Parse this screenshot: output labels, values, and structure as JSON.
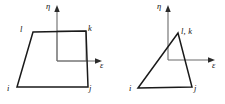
{
  "figure": {
    "colors": {
      "element_outline": "#1a1a1a",
      "axis": "#6b6b6b",
      "reference_square": "#8c8c8c",
      "background": "#ffffff",
      "label_text": "#111111"
    },
    "panels": [
      {
        "id": "left",
        "name": "quadrilateral-element",
        "shape_type": "quadrilateral",
        "axes": {
          "eta_label": "η",
          "epsilon_label": "ε",
          "origin": [
            57,
            61
          ],
          "eta_tip": [
            57,
            7
          ],
          "epsilon_tip": [
            101,
            61
          ]
        },
        "reference_square": {
          "x": 57,
          "y": 31,
          "width": 29,
          "height": 30
        },
        "nodes": [
          {
            "key": "i",
            "label": "i",
            "vertex": [
              17,
              87
            ],
            "label_pos": [
              7,
              84
            ]
          },
          {
            "key": "j",
            "label": "j",
            "vertex": [
              88,
              87
            ],
            "label_pos": [
              89,
              84
            ]
          },
          {
            "key": "k",
            "label": "k",
            "vertex": [
              86,
              31
            ],
            "label_pos": [
              88,
              24
            ]
          },
          {
            "key": "l",
            "label": "l",
            "vertex": [
              33,
              32
            ],
            "label_pos": [
              20,
              25
            ]
          }
        ],
        "outline_path": [
          [
            17,
            87
          ],
          [
            88,
            87
          ],
          [
            86,
            31
          ],
          [
            33,
            32
          ]
        ]
      },
      {
        "id": "right",
        "name": "degenerated-triangle-element",
        "shape_type": "triangle",
        "axes": {
          "eta_label": "η",
          "epsilon_label": "ε",
          "origin": [
            56,
            60
          ],
          "eta_tip": [
            56,
            7
          ],
          "epsilon_tip": [
            102,
            60
          ]
        },
        "nodes": [
          {
            "key": "i",
            "label": "i",
            "vertex": [
              26,
              88
            ],
            "label_pos": [
              17,
              84
            ]
          },
          {
            "key": "j",
            "label": "j",
            "vertex": [
              80,
              87
            ],
            "label_pos": [
              82,
              84
            ]
          },
          {
            "key": "lk",
            "label": "l, k",
            "vertex": [
              66,
              33
            ],
            "label_pos": [
              69,
              27
            ]
          }
        ],
        "outline_path": [
          [
            26,
            88
          ],
          [
            80,
            87
          ],
          [
            66,
            33
          ]
        ],
        "collapsed_edge_note": "nodes l and k coincide at the apex"
      }
    ]
  }
}
